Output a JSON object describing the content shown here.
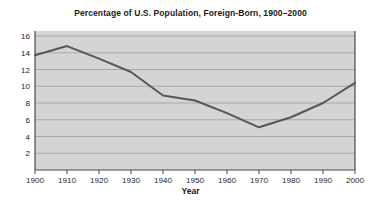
{
  "chart_data": {
    "type": "line",
    "title": "Percentage of U.S. Population, Foreign-Born, 1900–2000",
    "xlabel": "Year",
    "ylabel": "",
    "x": [
      1900,
      1910,
      1920,
      1930,
      1940,
      1950,
      1960,
      1970,
      1980,
      1990,
      2000
    ],
    "values": [
      13.7,
      14.8,
      13.3,
      11.7,
      8.9,
      8.3,
      6.8,
      5.1,
      6.3,
      8.0,
      10.4
    ],
    "series": [
      {
        "name": "Foreign-Born Percentage",
        "values": [
          13.7,
          14.8,
          13.3,
          11.7,
          8.9,
          8.3,
          6.8,
          5.1,
          6.3,
          8.0,
          10.4
        ]
      }
    ],
    "categories": [
      "1900",
      "1910",
      "1920",
      "1930",
      "1940",
      "1950",
      "1960",
      "1970",
      "1980",
      "1990",
      "2000"
    ],
    "x_tick_labels": [
      "1900",
      "1910",
      "1920",
      "1930",
      "1940",
      "1950",
      "1960",
      "1970",
      "1980",
      "1990",
      "2000"
    ],
    "y_tick_labels": [
      "2",
      "4",
      "6",
      "8",
      "10",
      "12",
      "14",
      "16"
    ],
    "y_ticks": [
      2,
      4,
      6,
      8,
      10,
      12,
      14,
      16
    ],
    "xlim": [
      1900,
      2000
    ],
    "ylim": [
      0,
      16.6
    ],
    "grid": "horizontal",
    "legend": "none",
    "line_color": "#57575a",
    "plot_background": "#d4d4d4",
    "grid_color": "#a8a8a8",
    "axis_color": "#4a4a4a",
    "text_color": "#1a1a1a"
  }
}
